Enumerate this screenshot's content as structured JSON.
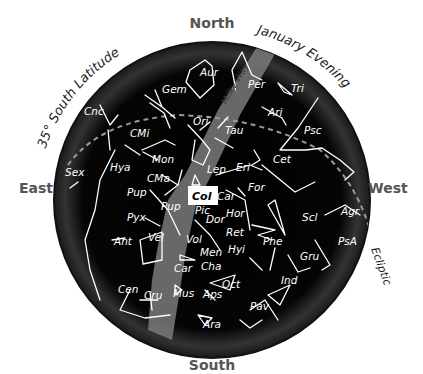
{
  "chart": {
    "title_left": "35° South Latitude",
    "title_right": "January Evening",
    "cardinals": {
      "north": "North",
      "south": "South",
      "east": "East",
      "west": "West"
    },
    "ecliptic_label": "Ecliptic",
    "milky_way_label": "Milky Way",
    "highlighted_constellation": "Col",
    "colors": {
      "sky": "#000000",
      "milky_way": "#7a7a7a",
      "lines": "#ffffff",
      "ecliptic": "#9a9a9a",
      "highlight_box": "#ffffff"
    }
  },
  "constellations": [
    {
      "abbr": "Aur",
      "x": 200,
      "y": 76
    },
    {
      "abbr": "Gem",
      "x": 162,
      "y": 93
    },
    {
      "abbr": "Per",
      "x": 248,
      "y": 88
    },
    {
      "abbr": "Tri",
      "x": 291,
      "y": 92
    },
    {
      "abbr": "Cnc",
      "x": 84,
      "y": 115
    },
    {
      "abbr": "Ari",
      "x": 268,
      "y": 116
    },
    {
      "abbr": "CMi",
      "x": 130,
      "y": 137
    },
    {
      "abbr": "Ori",
      "x": 193,
      "y": 125
    },
    {
      "abbr": "Tau",
      "x": 225,
      "y": 134
    },
    {
      "abbr": "Psc",
      "x": 304,
      "y": 134
    },
    {
      "abbr": "Cet",
      "x": 273,
      "y": 163
    },
    {
      "abbr": "Mon",
      "x": 152,
      "y": 163
    },
    {
      "abbr": "Hya",
      "x": 110,
      "y": 171
    },
    {
      "abbr": "Sex",
      "x": 65,
      "y": 176
    },
    {
      "abbr": "CMa",
      "x": 147,
      "y": 182
    },
    {
      "abbr": "Lep",
      "x": 207,
      "y": 173
    },
    {
      "abbr": "Eri",
      "x": 236,
      "y": 171
    },
    {
      "abbr": "Pup",
      "x": 127,
      "y": 196
    },
    {
      "abbr": "For",
      "x": 248,
      "y": 191
    },
    {
      "abbr": "Car",
      "x": 217,
      "y": 200
    },
    {
      "abbr": "Pup",
      "x": 161,
      "y": 210
    },
    {
      "abbr": "Pic",
      "x": 195,
      "y": 214
    },
    {
      "abbr": "Pyx",
      "x": 127,
      "y": 221
    },
    {
      "abbr": "Hor",
      "x": 226,
      "y": 217
    },
    {
      "abbr": "Scl",
      "x": 302,
      "y": 221
    },
    {
      "abbr": "Agr",
      "x": 341,
      "y": 215
    },
    {
      "abbr": "Dor",
      "x": 206,
      "y": 223
    },
    {
      "abbr": "Ret",
      "x": 226,
      "y": 236
    },
    {
      "abbr": "Vel",
      "x": 148,
      "y": 241
    },
    {
      "abbr": "Ant",
      "x": 114,
      "y": 245
    },
    {
      "abbr": "Vol",
      "x": 186,
      "y": 243
    },
    {
      "abbr": "Phe",
      "x": 263,
      "y": 245
    },
    {
      "abbr": "PsA",
      "x": 338,
      "y": 245
    },
    {
      "abbr": "Men",
      "x": 200,
      "y": 256
    },
    {
      "abbr": "Hyi",
      "x": 228,
      "y": 253
    },
    {
      "abbr": "Gru",
      "x": 300,
      "y": 260
    },
    {
      "abbr": "Cha",
      "x": 201,
      "y": 270
    },
    {
      "abbr": "Car",
      "x": 174,
      "y": 272
    },
    {
      "abbr": "Oct",
      "x": 222,
      "y": 288
    },
    {
      "abbr": "Ind",
      "x": 281,
      "y": 284
    },
    {
      "abbr": "Cen",
      "x": 118,
      "y": 293
    },
    {
      "abbr": "Cru",
      "x": 144,
      "y": 299
    },
    {
      "abbr": "Mus",
      "x": 173,
      "y": 297
    },
    {
      "abbr": "Aps",
      "x": 203,
      "y": 298
    },
    {
      "abbr": "Pav",
      "x": 250,
      "y": 310
    },
    {
      "abbr": "Ara",
      "x": 203,
      "y": 328
    }
  ]
}
